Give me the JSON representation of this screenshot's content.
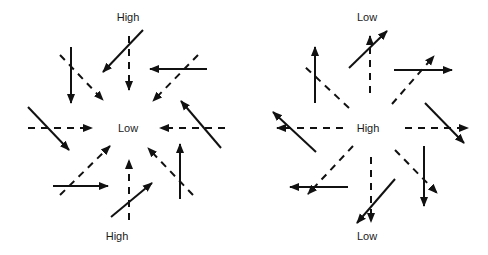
{
  "figure": {
    "line_color": "#111111",
    "background": "#ffffff"
  },
  "left_diagram": {
    "center_label": "Low",
    "top_label": "High",
    "bottom_label": "High",
    "dashed_arrows": [
      {
        "from": [
          129,
          36
        ],
        "to": [
          129,
          90
        ],
        "arrow": "end"
      },
      {
        "from": [
          60,
          55
        ],
        "to": [
          103,
          100
        ],
        "arrow": "end"
      },
      {
        "from": [
          198,
          55
        ],
        "to": [
          153,
          101
        ],
        "arrow": "end"
      },
      {
        "from": [
          28,
          128
        ],
        "to": [
          92,
          128
        ],
        "arrow": "end"
      },
      {
        "from": [
          225,
          128
        ],
        "to": [
          160,
          128
        ],
        "arrow": "end"
      },
      {
        "from": [
          60,
          195
        ],
        "to": [
          110,
          146
        ],
        "arrow": "end"
      },
      {
        "from": [
          193,
          195
        ],
        "to": [
          148,
          148
        ],
        "arrow": "end"
      },
      {
        "from": [
          129,
          220
        ],
        "to": [
          129,
          160
        ],
        "arrow": "end"
      }
    ],
    "solid_arrows": [
      {
        "from": [
          143,
          30
        ],
        "to": [
          103,
          72
        ]
      },
      {
        "from": [
          71,
          47
        ],
        "to": [
          71,
          103
        ]
      },
      {
        "from": [
          207,
          69
        ],
        "to": [
          150,
          69
        ]
      },
      {
        "from": [
          28,
          107
        ],
        "to": [
          69,
          150
        ]
      },
      {
        "from": [
          221,
          148
        ],
        "to": [
          181,
          101
        ]
      },
      {
        "from": [
          53,
          186
        ],
        "to": [
          108,
          186
        ]
      },
      {
        "from": [
          180,
          199
        ],
        "to": [
          180,
          144
        ]
      },
      {
        "from": [
          111,
          217
        ],
        "to": [
          152,
          183
        ]
      }
    ]
  },
  "right_diagram": {
    "center_label": "High",
    "top_label": "Low",
    "bottom_label": "Low",
    "dashed_arrows": [
      {
        "from": [
          370,
          93
        ],
        "to": [
          370,
          36
        ],
        "arrow": "end"
      },
      {
        "from": [
          405,
          128
        ],
        "to": [
          468,
          128
        ],
        "arrow": "end"
      },
      {
        "from": [
          343,
          128
        ],
        "to": [
          277,
          128
        ],
        "arrow": "end"
      },
      {
        "from": [
          371,
          157
        ],
        "to": [
          371,
          222
        ],
        "arrow": "end"
      },
      {
        "from": [
          349,
          108
        ],
        "to": [
          303,
          65
        ],
        "arrow": "none"
      },
      {
        "from": [
          392,
          104
        ],
        "to": [
          434,
          56
        ],
        "arrow": "end"
      },
      {
        "from": [
          353,
          146
        ],
        "to": [
          308,
          194
        ],
        "arrow": "end"
      },
      {
        "from": [
          395,
          150
        ],
        "to": [
          437,
          193
        ],
        "arrow": "end"
      }
    ],
    "solid_arrows": [
      {
        "from": [
          349,
          68
        ],
        "to": [
          387,
          31
        ]
      },
      {
        "from": [
          315,
          103
        ],
        "to": [
          315,
          47
        ]
      },
      {
        "from": [
          394,
          70
        ],
        "to": [
          452,
          70
        ]
      },
      {
        "from": [
          425,
          103
        ],
        "to": [
          464,
          143
        ]
      },
      {
        "from": [
          316,
          152
        ],
        "to": [
          273,
          112
        ]
      },
      {
        "from": [
          348,
          187
        ],
        "to": [
          290,
          187
        ]
      },
      {
        "from": [
          424,
          146
        ],
        "to": [
          424,
          206
        ]
      },
      {
        "from": [
          395,
          179
        ],
        "to": [
          357,
          223
        ]
      }
    ]
  }
}
